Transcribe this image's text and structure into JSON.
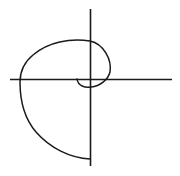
{
  "diagram": {
    "type": "spiral-curve-on-axes",
    "stroke_color": "#1a1a1a",
    "background": "#ffffff",
    "axes": {
      "horizontal": {
        "x1": 10,
        "y1": 79.5,
        "x2": 172,
        "y2": 79.5
      },
      "vertical": {
        "x1": 90.5,
        "y1": 9,
        "x2": 90.5,
        "y2": 166
      }
    },
    "curve": {
      "path": "M 77 79 C 78 86, 85 88, 91 87 C 100 86, 108 80, 110 72 C 112 60, 104 44, 90 41 C 70 38, 48 42, 33 55 C 22 64, 20 74, 20 82 C 20 100, 24 118, 36 132 C 50 148, 70 158, 90 159",
      "start": [
        77,
        79
      ],
      "end": [
        90,
        159
      ]
    }
  }
}
